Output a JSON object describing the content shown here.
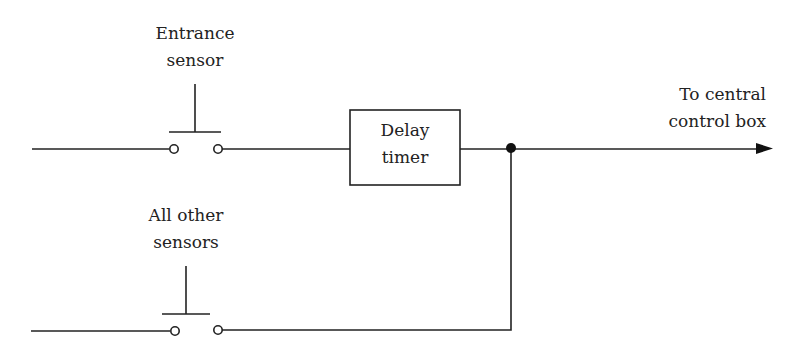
{
  "diagram": {
    "type": "circuit-schematic",
    "stroke_color": "#222222",
    "background": "#ffffff",
    "labels": {
      "entrance_sensor": [
        "Entrance",
        "sensor"
      ],
      "other_sensors": [
        "All other",
        "sensors"
      ],
      "delay_timer": [
        "Delay",
        "timer"
      ],
      "output": [
        "To central",
        "control box"
      ]
    },
    "components": [
      {
        "id": "entrance-switch",
        "kind": "push-button-switch-normally-open",
        "label": "Entrance sensor"
      },
      {
        "id": "other-switch",
        "kind": "push-button-switch-normally-open",
        "label": "All other sensors"
      },
      {
        "id": "delay-timer",
        "kind": "block",
        "label": "Delay timer"
      },
      {
        "id": "junction",
        "kind": "junction-dot"
      },
      {
        "id": "output-arrow",
        "kind": "arrow",
        "label": "To central control box"
      }
    ],
    "connections": [
      "input-line-1 -> entrance-switch",
      "entrance-switch -> delay-timer",
      "delay-timer -> junction",
      "input-line-2 -> other-switch",
      "other-switch -> junction",
      "junction -> output-arrow"
    ]
  }
}
